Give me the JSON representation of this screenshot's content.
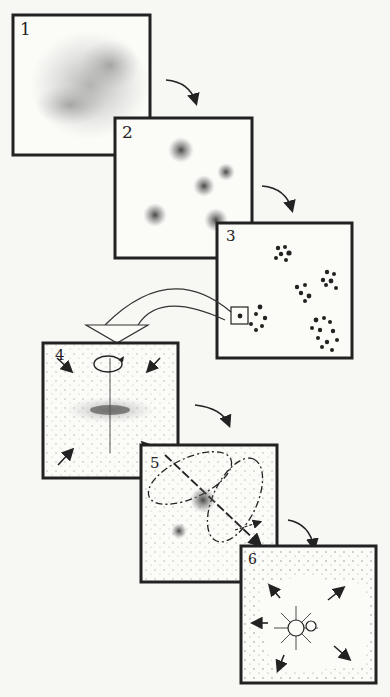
{
  "diagram": {
    "panels": [
      {
        "label": "1",
        "content": "diffuse interstellar gas cloud"
      },
      {
        "label": "2",
        "content": "cloud fragments into dense cores"
      },
      {
        "label": "3",
        "content": "clusters of collapsing clumps; one clump magnified"
      },
      {
        "label": "4",
        "content": "rotating core collapses into a flattened disk"
      },
      {
        "label": "5",
        "content": "protostar with bipolar outflow and magnetic field loops"
      },
      {
        "label": "6",
        "content": "new binary stars clear surrounding gas"
      }
    ],
    "colors": {
      "ink": "#222222",
      "paper": "#fbfbf8"
    }
  }
}
